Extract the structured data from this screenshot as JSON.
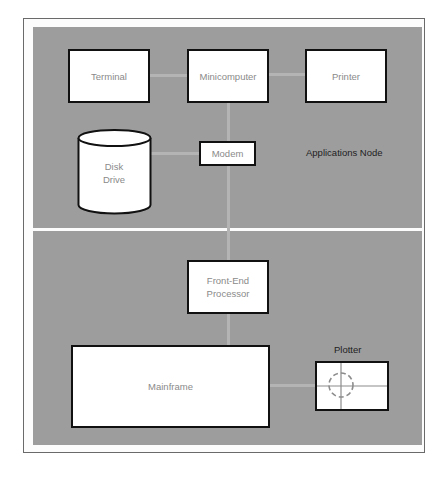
{
  "diagram": {
    "colors": {
      "panel": "#9d9d9d",
      "connector": "#b4b4b4",
      "box_fill": "#ffffff",
      "box_border": "#111111",
      "box_text": "#8a8a8a",
      "label_text": "#1e1e1e"
    },
    "regions": {
      "top": {
        "label": "Applications Node"
      },
      "bottom": {
        "label": ""
      }
    },
    "nodes": {
      "terminal": {
        "label": "Terminal",
        "shape": "rectangle"
      },
      "minicomputer": {
        "label": "Minicomputer",
        "shape": "rectangle"
      },
      "printer": {
        "label": "Printer",
        "shape": "rectangle"
      },
      "disk_drive": {
        "label": "Disk\nDrive",
        "shape": "cylinder"
      },
      "modem": {
        "label": "Modem",
        "shape": "rectangle"
      },
      "front_end_processor": {
        "label": "Front-End\nProcessor",
        "shape": "rectangle"
      },
      "mainframe": {
        "label": "Mainframe",
        "shape": "rectangle"
      },
      "plotter": {
        "label": "Plotter",
        "shape": "rectangle-with-crosshair"
      }
    },
    "edges": [
      {
        "from": "Terminal",
        "to": "Minicomputer"
      },
      {
        "from": "Minicomputer",
        "to": "Printer"
      },
      {
        "from": "Minicomputer",
        "to": "Modem"
      },
      {
        "from": "Modem",
        "to": "Disk Drive"
      },
      {
        "from": "Modem",
        "to": "Front-End Processor"
      },
      {
        "from": "Front-End Processor",
        "to": "Mainframe"
      },
      {
        "from": "Mainframe",
        "to": "Plotter"
      }
    ]
  }
}
